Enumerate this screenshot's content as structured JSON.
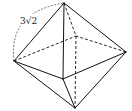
{
  "diagram": {
    "type": "octahedron",
    "edge_label": "3√2",
    "vertices": {
      "top": [
        64,
        3
      ],
      "left": [
        14,
        61
      ],
      "right": [
        126,
        52
      ],
      "front": [
        63,
        79
      ],
      "back": [
        76,
        36
      ],
      "bottom": [
        75,
        108
      ]
    },
    "colors": {
      "stroke": "#111111",
      "background": "#ffffff"
    }
  }
}
